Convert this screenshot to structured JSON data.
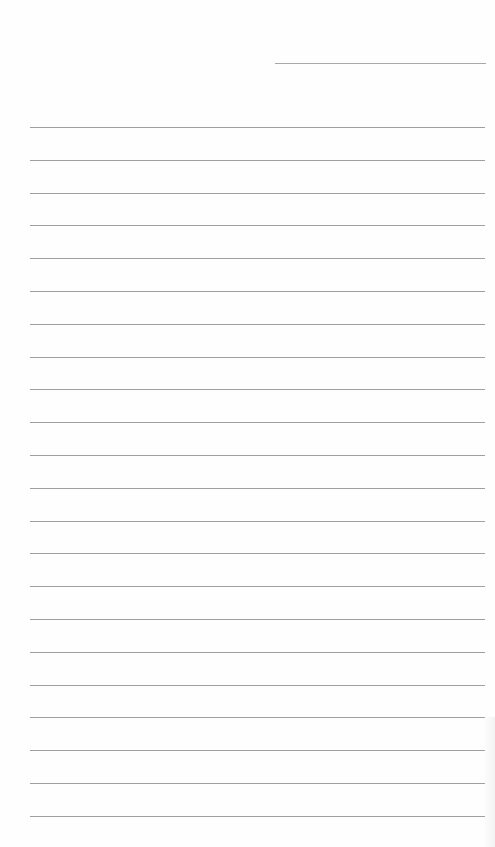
{
  "document": {
    "type": "lined-paper",
    "header_line": {
      "x": 275,
      "y": 63,
      "width": 211
    },
    "rules": {
      "count": 22,
      "first_y": 127,
      "spacing": 32.8,
      "left": 30,
      "width": 455,
      "color": "#9f9f9f"
    },
    "text": []
  }
}
